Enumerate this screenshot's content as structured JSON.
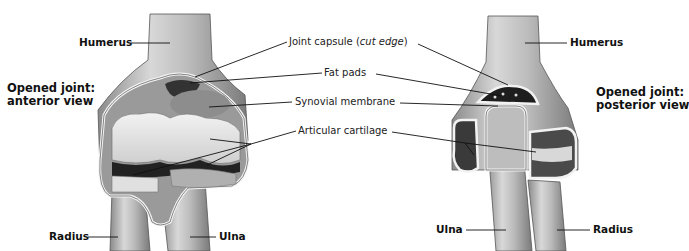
{
  "figure": {
    "left_view": {
      "title_line1": "Opened joint:",
      "title_line2": "anterior view",
      "labels": {
        "humerus": "Humerus",
        "radius": "Radius",
        "ulna": "Ulna"
      }
    },
    "right_view": {
      "title_line1": "Opened joint:",
      "title_line2": "posterior view",
      "labels": {
        "humerus": "Humerus",
        "ulna": "Ulna",
        "radius": "Radius"
      }
    },
    "shared_labels": {
      "joint_capsule": "Joint capsule (",
      "joint_capsule_italic": "cut edge",
      "joint_capsule_close": ")",
      "fat_pads": "Fat pads",
      "synovial_membrane": "Synovial membrane",
      "articular_cartilage": "Articular cartilage"
    },
    "colors": {
      "background": "#ffffff",
      "bone_light": "#e6e6e6",
      "bone_mid": "#b5b5b5",
      "bone_dark": "#6e6e6e",
      "cavity": "#2a2a2a",
      "leader_line": "#111111"
    }
  }
}
